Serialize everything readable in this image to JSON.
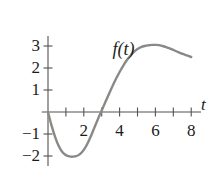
{
  "chart_data": {
    "type": "line",
    "title": "",
    "function_label": "f(t)",
    "xlabel": "t",
    "ylabel": "",
    "grid": false,
    "legend": "none",
    "xlim": [
      -0.35,
      8.9
    ],
    "ylim": [
      -2.45,
      3.45
    ],
    "x_ticks": [
      1,
      2,
      3,
      4,
      5,
      6,
      7,
      8
    ],
    "x_tick_labels": [
      "",
      "2",
      "",
      "4",
      "",
      "6",
      "",
      "8"
    ],
    "y_ticks": [
      -2,
      -1,
      1,
      2,
      3
    ],
    "y_tick_labels": [
      "−2",
      "−1",
      "1",
      "2",
      "3"
    ],
    "curve_color": "#8b8986",
    "axis_color": "#55524f",
    "text_color": "#1d1b1a",
    "x": [
      0.0,
      0.2,
      0.4,
      0.6,
      0.8,
      1.0,
      1.2,
      1.4,
      1.6,
      1.8,
      2.0,
      2.2,
      2.4,
      2.6,
      2.8,
      3.0,
      3.2,
      3.4,
      3.6,
      3.8,
      4.0,
      4.2,
      4.4,
      4.6,
      4.8,
      5.0,
      5.2,
      5.4,
      5.6,
      5.8,
      6.0,
      6.2,
      6.4,
      6.6,
      6.8,
      7.0,
      7.2,
      7.4,
      7.6,
      7.8,
      8.0
    ],
    "y": [
      0.0,
      -0.62,
      -1.14,
      -1.55,
      -1.82,
      -1.96,
      -2.02,
      -2.03,
      -2.0,
      -1.9,
      -1.72,
      -1.44,
      -1.09,
      -0.69,
      -0.3,
      0.07,
      0.44,
      0.81,
      1.17,
      1.51,
      1.82,
      2.1,
      2.35,
      2.56,
      2.73,
      2.86,
      2.95,
      3.0,
      3.03,
      3.05,
      3.05,
      3.04,
      3.0,
      2.95,
      2.89,
      2.82,
      2.75,
      2.68,
      2.62,
      2.56,
      2.5
    ],
    "annotations": [
      {
        "label": "minimum",
        "t": 1.4,
        "value": -2.03
      },
      {
        "label": "zero-crossing",
        "t": 2.96,
        "value": 0.0
      },
      {
        "label": "maximum",
        "t": 6.05,
        "value": 3.05
      }
    ]
  },
  "geometry": {
    "origin_x": 48,
    "origin_y": 112,
    "x_unit_px": 17.9,
    "y_unit_px": 22.0
  }
}
